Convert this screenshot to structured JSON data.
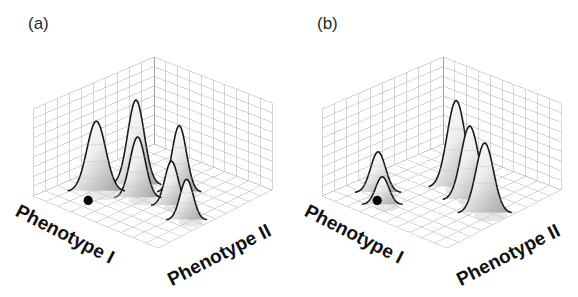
{
  "figure": {
    "caption_note": "",
    "background_color": "#ffffff",
    "width": 578,
    "height": 297
  },
  "panels": [
    {
      "tag": "(a)",
      "axis_x_label": "Phenotype I",
      "axis_y_label": "Phenotype II",
      "marker_name": "reference-point"
    },
    {
      "tag": "(b)",
      "axis_x_label": "Phenotype I",
      "axis_y_label": "Phenotype II",
      "marker_name": "reference-point"
    }
  ],
  "chart_data": {
    "type": "surface",
    "title": "",
    "xlabel": "Phenotype I",
    "ylabel": "Phenotype II",
    "zlabel": "",
    "grid": true,
    "legend": null,
    "projection": "3d-isometric",
    "grid_divisions": {
      "x": 10,
      "y": 10,
      "z": 9
    },
    "panels": [
      {
        "tag": "(a)",
        "description": "Adaptive landscape with six fitness peaks of varying height; black marker denotes population position on the landscape.",
        "marker": {
          "x": 0.27,
          "y": 0.18,
          "label": ""
        },
        "peaks": [
          {
            "x": 0.22,
            "y": 0.3,
            "height": 0.38,
            "width": 0.085
          },
          {
            "x": 0.33,
            "y": 0.52,
            "height": 0.46,
            "width": 0.075
          },
          {
            "x": 0.46,
            "y": 0.4,
            "height": 0.33,
            "width": 0.07
          },
          {
            "x": 0.59,
            "y": 0.62,
            "height": 0.36,
            "width": 0.065
          },
          {
            "x": 0.68,
            "y": 0.46,
            "height": 0.24,
            "width": 0.06
          },
          {
            "x": 0.88,
            "y": 0.38,
            "height": 0.22,
            "width": 0.06
          }
        ]
      },
      {
        "tag": "(b)",
        "description": "Adaptive landscape after selection; peaks nearer the marker are reduced while distant peaks grow taller.",
        "marker": {
          "x": 0.27,
          "y": 0.18,
          "label": ""
        },
        "peaks": [
          {
            "x": 0.2,
            "y": 0.26,
            "height": 0.22,
            "width": 0.068
          },
          {
            "x": 0.33,
            "y": 0.16,
            "height": 0.15,
            "width": 0.06
          },
          {
            "x": 0.49,
            "y": 0.62,
            "height": 0.47,
            "width": 0.082
          },
          {
            "x": 0.67,
            "y": 0.55,
            "height": 0.4,
            "width": 0.08
          },
          {
            "x": 0.86,
            "y": 0.48,
            "height": 0.38,
            "width": 0.08
          }
        ]
      }
    ]
  },
  "colors": {
    "grid_line": "#b9b9b9",
    "floor_line": "#c4c4c4",
    "peak_outline": "#1a1a1a",
    "peak_fill_light": "#ffffff",
    "peak_fill_shadow": "#9a9a9a",
    "marker": "#000000",
    "text": "#111111",
    "tag_text": "#2a2a2a"
  }
}
